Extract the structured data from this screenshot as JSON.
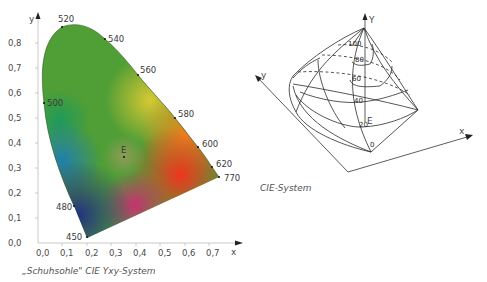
{
  "left_figure": {
    "caption": "„Schuhsohle\" CIE Yxy-System",
    "y_axis_label": "y",
    "x_axis_label": "x",
    "y_ticks": [
      "0,0",
      "0,1",
      "0,2",
      "0,3",
      "0,4",
      "0,5",
      "0,6",
      "0,7",
      "0,8"
    ],
    "x_ticks": [
      "0,0",
      "0,1",
      "0,2",
      "0,3",
      "0,4",
      "0,5",
      "0,6",
      "0,7"
    ],
    "wavelengths": [
      {
        "label": "520",
        "x": 0.08,
        "y": 0.84
      },
      {
        "label": "540",
        "x": 0.23,
        "y": 0.75
      },
      {
        "label": "560",
        "x": 0.37,
        "y": 0.62
      },
      {
        "label": "580",
        "x": 0.51,
        "y": 0.49
      },
      {
        "label": "600",
        "x": 0.62,
        "y": 0.37
      },
      {
        "label": "620",
        "x": 0.69,
        "y": 0.3
      },
      {
        "label": "770",
        "x": 0.73,
        "y": 0.26
      },
      {
        "label": "500",
        "x": 0.01,
        "y": 0.54
      },
      {
        "label": "480",
        "x": 0.09,
        "y": 0.13
      },
      {
        "label": "450",
        "x": 0.16,
        "y": 0.02
      }
    ],
    "white_point": {
      "label": "E",
      "x": 0.33,
      "y": 0.33
    }
  },
  "right_figure": {
    "caption": "CIE-System",
    "Y_axis_label": "Y",
    "y_axis_label": "y",
    "x_axis_label": "x",
    "levels": [
      "100",
      "80",
      "60",
      "40",
      "20",
      "0"
    ],
    "white_point_label": "E"
  }
}
